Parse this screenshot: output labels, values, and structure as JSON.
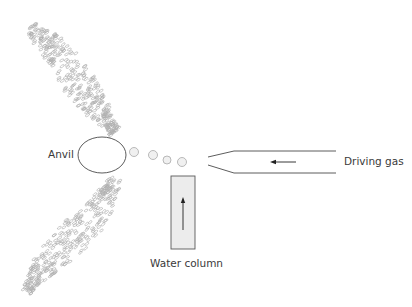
{
  "diagram": {
    "labels": {
      "anvil": "Anvil",
      "driving_gas": "Driving gas",
      "water_column": "Water column"
    },
    "components": {
      "anvil": {
        "cx": 102,
        "cy": 155,
        "rx": 24,
        "ry": 18
      },
      "droplets": [
        {
          "cx": 134,
          "cy": 152,
          "r": 4.5
        },
        {
          "cx": 153,
          "cy": 155,
          "r": 4.5
        },
        {
          "cx": 167,
          "cy": 160,
          "r": 4.0
        },
        {
          "cx": 182,
          "cy": 162,
          "r": 4.5
        }
      ],
      "nozzle": {
        "tip_x": 208,
        "shoulder_x": 234,
        "end_x": 336,
        "top_y": 151,
        "bottom_y": 173,
        "tip_top_y": 157,
        "tip_bottom_y": 165
      },
      "gas_arrow": {
        "from_x": 296,
        "to_x": 270,
        "y": 162
      },
      "water_column": {
        "x": 171,
        "y": 176,
        "width": 24,
        "height": 73
      },
      "water_arrow": {
        "x": 183,
        "from_y": 230,
        "to_y": 198
      }
    },
    "spray_bands": {
      "upper": {
        "start": [
          28,
          28
        ],
        "end": [
          118,
          135
        ]
      },
      "lower": {
        "start": [
          112,
          178
        ],
        "end": [
          25,
          295
        ]
      }
    },
    "colors": {
      "outline": "#4a4a4a",
      "particle": "#b0b0b0",
      "water_fill": "#ececec",
      "text": "#3a3a3a"
    }
  }
}
